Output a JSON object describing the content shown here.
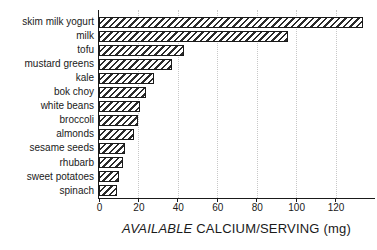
{
  "chart_data": {
    "type": "bar",
    "orientation": "horizontal",
    "title": "",
    "categories": [
      "skim milk yogurt",
      "milk",
      "tofu",
      "mustard greens",
      "kale",
      "bok choy",
      "white beans",
      "broccoli",
      "almonds",
      "sesame seeds",
      "rhubarb",
      "sweet potatoes",
      "spinach"
    ],
    "values": [
      134,
      96,
      43,
      37,
      28,
      24,
      21,
      20,
      18,
      13,
      12,
      10,
      9
    ],
    "xlabel_parts": [
      {
        "text": "AVAILABLE",
        "italic": true
      },
      {
        "text": " CALCIUM/SERVING (mg)",
        "italic": false
      }
    ],
    "xticks": [
      0,
      20,
      40,
      60,
      80,
      100,
      120
    ],
    "xlim": [
      0,
      140
    ],
    "grid": {
      "vertical": true,
      "style": "dotted",
      "at": [
        20,
        40,
        60,
        80,
        100,
        120
      ]
    },
    "legend": null,
    "bar_style": {
      "fill": "hatch-diagonal",
      "hatch_color": "#2b2b2b",
      "outline_color": "#1a1a1a",
      "background_color": "#ffffff"
    }
  },
  "colors": {
    "axis": "#1a1a1a",
    "grid": "#c8c8c8",
    "text": "#1a1a1a",
    "background": "#ffffff"
  }
}
